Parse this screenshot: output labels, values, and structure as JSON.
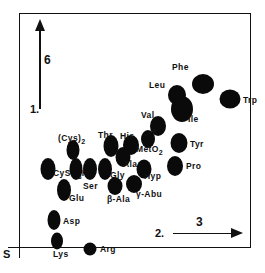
{
  "figure": {
    "type": "2d-separation-map",
    "origin_marker": "S"
  },
  "axes": {
    "vertical": {
      "dimension_label": "6",
      "step_label": "1.",
      "name": "first-dimension-axis"
    },
    "horizontal": {
      "dimension_label": "3",
      "step_label": "2.",
      "name": "second-dimension-axis"
    }
  },
  "chart_data": {
    "type": "scatter",
    "title": "",
    "xlabel": "2. → 3",
    "ylabel": "1. ↑ 6",
    "xlim": [
      0,
      232
    ],
    "ylim": [
      0,
      235
    ],
    "grid": false,
    "legend": "none",
    "annotations": {
      "origin": "S",
      "vertical_arrow": [
        "1.",
        "6"
      ],
      "horizontal_arrow": [
        "2.",
        "3"
      ]
    },
    "points": [
      {
        "label": "Phe",
        "html": "Phe",
        "x": 183,
        "y": 70,
        "rx": 11,
        "ry": 10,
        "lx": 152,
        "ly": 49,
        "rot": 0
      },
      {
        "label": "Trp",
        "html": "Trp",
        "x": 210,
        "y": 85,
        "rx": 10.5,
        "ry": 9.5,
        "lx": 223,
        "ly": 82,
        "rot": 0
      },
      {
        "label": "Leu",
        "html": "Leu",
        "x": 157,
        "y": 81,
        "rx": 9,
        "ry": 10,
        "lx": 129,
        "ly": 67,
        "rot": 0
      },
      {
        "label": "Ile",
        "html": "Ile",
        "x": 162,
        "y": 95,
        "rx": 11,
        "ry": 13,
        "lx": 168,
        "ly": 101,
        "rot": 0
      },
      {
        "label": "Val",
        "html": "Val",
        "x": 138,
        "y": 112,
        "rx": 8,
        "ry": 10,
        "lx": 121,
        "ly": 97,
        "rot": 0
      },
      {
        "label": "Tyr",
        "html": "Tyr",
        "x": 159,
        "y": 129,
        "rx": 8.5,
        "ry": 10,
        "lx": 170,
        "ly": 126,
        "rot": 0
      },
      {
        "label": "His",
        "html": "His",
        "x": 111,
        "y": 131,
        "rx": 8,
        "ry": 10,
        "lx": 100,
        "ly": 118,
        "rot": 0
      },
      {
        "label": "Thr",
        "html": "Thr",
        "x": 91,
        "y": 132,
        "rx": 7.5,
        "ry": 11,
        "lx": 78,
        "ly": 117,
        "rot": 0
      },
      {
        "label": "MetO2",
        "html": "MetO<sub>2</sub>",
        "x": 128,
        "y": 125,
        "rx": 7,
        "ry": 9,
        "lx": 116,
        "ly": 131,
        "rot": 0
      },
      {
        "label": "Ala",
        "html": "Ala",
        "x": 103,
        "y": 143,
        "rx": 7.5,
        "ry": 10,
        "lx": 103,
        "ly": 146,
        "rot": 0
      },
      {
        "label": "(Cys)2",
        "html": "(Cys)<sub>2</sub>",
        "x": 53,
        "y": 136,
        "rx": 6.5,
        "ry": 10,
        "lx": 38,
        "ly": 120,
        "rot": 0
      },
      {
        "label": "Pro",
        "html": "Pro",
        "x": 155,
        "y": 152,
        "rx": 8,
        "ry": 10,
        "lx": 166,
        "ly": 148,
        "rot": 0
      },
      {
        "label": "Hyp",
        "html": "Hyp",
        "x": 124,
        "y": 155,
        "rx": 7.5,
        "ry": 9.5,
        "lx": 124,
        "ly": 158,
        "rot": 0
      },
      {
        "label": "Gly",
        "html": "Gly",
        "x": 85,
        "y": 155,
        "rx": 7,
        "ry": 11,
        "lx": 90,
        "ly": 157,
        "rot": 0
      },
      {
        "label": "CySO3H",
        "html": "CySO<sub>3</sub>H",
        "x": 28,
        "y": 155,
        "rx": 7.5,
        "ry": 11,
        "lx": 33,
        "ly": 155,
        "rot": 0
      },
      {
        "label": "Ser",
        "html": "Ser",
        "x": 70,
        "y": 155,
        "rx": 7,
        "ry": 11,
        "lx": 63,
        "ly": 168,
        "rot": 0
      },
      {
        "label": "Ser2",
        "html": "",
        "x": 56,
        "y": 155,
        "rx": 6.5,
        "ry": 11,
        "lx": 0,
        "ly": 0,
        "rot": 0
      },
      {
        "label": "Glu",
        "html": "Glu",
        "x": 44,
        "y": 176,
        "rx": 7,
        "ry": 11,
        "lx": 49,
        "ly": 180,
        "rot": 0
      },
      {
        "label": "bAla",
        "html": "β-Ala",
        "x": 95,
        "y": 172,
        "rx": 7.5,
        "ry": 9,
        "lx": 87,
        "ly": 181,
        "rot": 0
      },
      {
        "label": "gAbu",
        "html": "γ-Abu",
        "x": 114,
        "y": 170,
        "rx": 8,
        "ry": 9,
        "lx": 116,
        "ly": 176,
        "rot": 0
      },
      {
        "label": "Asp",
        "html": "Asp",
        "x": 34,
        "y": 206,
        "rx": 6.5,
        "ry": 10,
        "lx": 43,
        "ly": 203,
        "rot": 0
      },
      {
        "label": "Lys",
        "html": "Lys",
        "x": 37,
        "y": 227,
        "rx": 6,
        "ry": 8.5,
        "lx": 33,
        "ly": 236,
        "rot": 0
      },
      {
        "label": "Arg",
        "html": "Arg",
        "x": 70,
        "y": 235,
        "rx": 6.5,
        "ry": 6.5,
        "lx": 80,
        "ly": 231,
        "rot": 0
      }
    ]
  }
}
